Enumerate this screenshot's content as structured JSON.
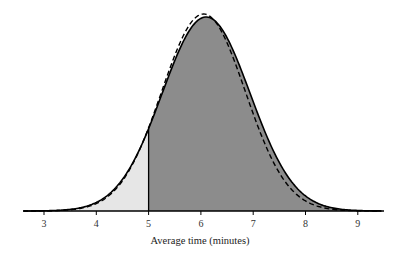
{
  "chart_data": {
    "type": "area",
    "title": "",
    "xlabel": "Average time (minutes)",
    "ylabel": "",
    "xlim": [
      2.6,
      9.45
    ],
    "xticks": [
      3,
      4,
      5,
      6,
      7,
      8,
      9
    ],
    "grid": false,
    "legend": null,
    "series": [
      {
        "name": "solid-density",
        "style": "solid",
        "distribution": "normal",
        "mean": 6.1,
        "sd": 0.84
      },
      {
        "name": "dashed-density",
        "style": "dashed",
        "distribution": "normal",
        "mean": 6.05,
        "sd": 0.8
      }
    ],
    "shaded_regions": [
      {
        "from": 2.6,
        "to": 5,
        "fill": "#e6e6e6",
        "label": "below 5"
      },
      {
        "from": 5,
        "to": 9.45,
        "fill": "#8c8c8c",
        "label": "above 5"
      }
    ],
    "annotations": [
      {
        "type": "vertical-line",
        "x": 5
      }
    ]
  },
  "colors": {
    "light_fill": "#e6e6e6",
    "dark_fill": "#8c8c8c",
    "curve": "#000000"
  }
}
